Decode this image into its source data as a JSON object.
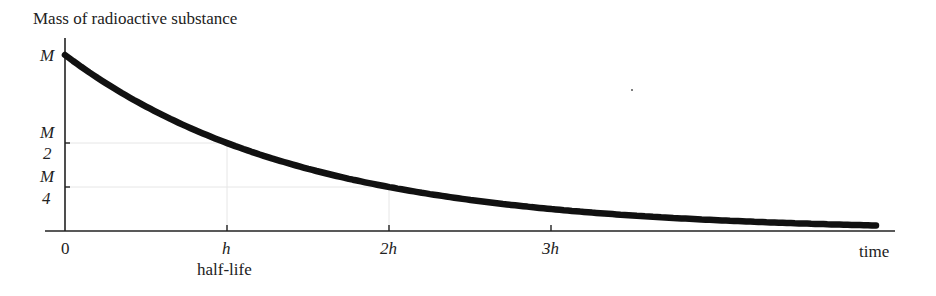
{
  "chart_data": {
    "type": "line",
    "title": "Mass of radioactive substance",
    "ylabel": "Mass of radioactive substance",
    "xlabel": "time",
    "x_ticks": [
      {
        "label": "0",
        "value": 0
      },
      {
        "label": "h",
        "value": 1,
        "sublabel": "half-life"
      },
      {
        "label": "2h",
        "value": 2
      },
      {
        "label": "3h",
        "value": 3
      }
    ],
    "y_ticks": [
      {
        "label": "M",
        "value": 1.0
      },
      {
        "label": "M/2",
        "numerator": "M",
        "denominator": "2",
        "value": 0.5
      },
      {
        "label": "M/4",
        "numerator": "M",
        "denominator": "4",
        "value": 0.25
      }
    ],
    "series": [
      {
        "name": "mass",
        "formula": "M * (1/2)^(t/h)",
        "x": [
          0,
          0.5,
          1,
          1.5,
          2,
          2.5,
          3,
          3.5,
          4,
          4.5,
          5
        ],
        "y": [
          1.0,
          0.707,
          0.5,
          0.354,
          0.25,
          0.177,
          0.125,
          0.088,
          0.0625,
          0.044,
          0.031
        ]
      }
    ],
    "xlim": [
      0,
      5.1
    ],
    "ylim": [
      0,
      1.0
    ],
    "grid": "faint guide lines at (h, M/2) and (2h, M/4)",
    "legend": "none"
  },
  "labels": {
    "title": "Mass of radioactive substance",
    "y_M": "M",
    "y_half_num": "M",
    "y_half_den": "2",
    "y_quarter_num": "M",
    "y_quarter_den": "4",
    "x_0": "0",
    "x_h": "h",
    "x_2h": "2h",
    "x_3h": "3h",
    "x_halflife": "half-life",
    "x_time": "time"
  },
  "colors": {
    "curve": "#111111",
    "axis": "#222222",
    "guide": "#e4e4e4"
  }
}
